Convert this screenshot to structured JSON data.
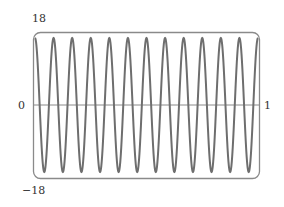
{
  "chart_data": {
    "type": "line",
    "title": "",
    "xlabel": "",
    "ylabel": "",
    "function": "y = 18 cos(24 pi x)",
    "cycles": 12,
    "amplitude": 18,
    "xlim": [
      0,
      1
    ],
    "ylim": [
      -18,
      18
    ],
    "tick_labels": {
      "y_top": "18",
      "y_bottom": "-18",
      "x_left": "0",
      "x_right": "1"
    },
    "grid": false,
    "legend": null,
    "series": [
      {
        "name": "curve",
        "x": [
          0,
          0.0417,
          0.0833,
          0.125,
          0.1667,
          0.2083,
          0.25,
          0.2917,
          0.3333,
          0.375,
          0.4167,
          0.4583,
          0.5,
          0.5417,
          0.5833,
          0.625,
          0.6667,
          0.7083,
          0.75,
          0.7917,
          0.8333,
          0.875,
          0.9167,
          0.9583,
          1
        ],
        "values": [
          18,
          -18,
          18,
          -18,
          18,
          -18,
          18,
          -18,
          18,
          -18,
          18,
          -18,
          18,
          -18,
          18,
          -18,
          18,
          -18,
          18,
          -18,
          18,
          -18,
          18,
          -18,
          18
        ]
      }
    ],
    "colors": {
      "curve": "#6e6e6e",
      "frame": "#8a8a8a",
      "axis": "#8a8a8a"
    }
  },
  "labels": {
    "y_max": "18",
    "y_min": "−18",
    "x_min": "0",
    "x_max": "1"
  }
}
